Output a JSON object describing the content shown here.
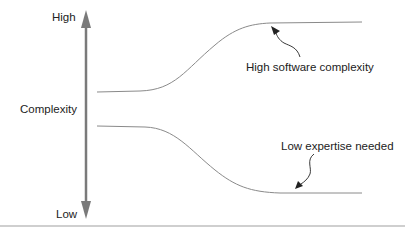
{
  "diagram": {
    "axis": {
      "top_label": "High",
      "middle_label": "Complexity",
      "bottom_label": "Low"
    },
    "curves": [
      {
        "name": "software-complexity",
        "trend": "rises from middle to high",
        "annotation": "High software complexity"
      },
      {
        "name": "expertise-needed",
        "trend": "falls from middle to low",
        "annotation": "Low expertise needed"
      }
    ],
    "colors": {
      "axis": "#7a7a7a",
      "curve": "#8a8a8a",
      "annotation_arrow": "#222222",
      "divider": "#a0a0a0"
    }
  }
}
